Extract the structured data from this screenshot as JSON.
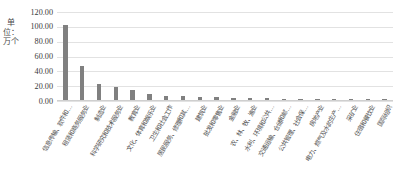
{
  "chart_data": {
    "type": "bar",
    "title": "",
    "subtitle": "",
    "xlabel": "",
    "ylabel": "单位：万个",
    "ylim": [
      0,
      120
    ],
    "ytick_step": 20,
    "grid": true,
    "legend": false,
    "bar_color": "#808080",
    "gridline_color": "#e2e2e2",
    "ytick_labels": [
      "120.00",
      "100.00",
      "80.00",
      "60.00",
      "40.00",
      "20.00",
      "0.00"
    ],
    "ytick_values": [
      120,
      100,
      80,
      60,
      40,
      20,
      0
    ],
    "categories": [
      "信息传输、软件和…",
      "租赁和商务服务业",
      "制造业",
      "科学研究和技术服务业",
      "教育业",
      "文化、体育和娱乐业",
      "卫生和社会工作",
      "居民服务、修理和其…",
      "建筑业",
      "批发和零售业",
      "金融业",
      "农、林、牧、渔业",
      "水利、环境和公共…",
      "交通运输、仓储和邮…",
      "公共管理、社会保…",
      "房地产业",
      "电力、燃气及水的生产…",
      "采矿业",
      "住宿和餐饮业",
      "国际组织"
    ],
    "values": [
      101.0,
      46.0,
      21.0,
      17.0,
      14.0,
      7.5,
      6.0,
      5.0,
      4.2,
      3.6,
      3.0,
      2.6,
      2.2,
      1.9,
      1.6,
      1.3,
      1.1,
      0.9,
      0.6,
      0.3
    ]
  }
}
